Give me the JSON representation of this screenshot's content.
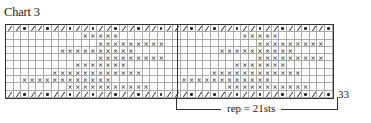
{
  "title": "Chart 3",
  "row_number": "33",
  "repeat_label": "rep = 21sts",
  "grid": {
    "columns": 43,
    "repeat_start_col": 22,
    "repeat_width": 21,
    "top_row": "//•//•//•//•//•//•//•///•//•//•//•//•//•//•",
    "bottom_row": "//•//•//•//•//•//•//•///•//•//•//•//•//•//•",
    "pattern_rows_local_ranges": [
      [
        9,
        13
      ],
      [
        11,
        19
      ],
      [
        6,
        15
      ],
      [
        11,
        19
      ],
      [
        8,
        14
      ],
      [
        5,
        16
      ],
      [
        1,
        12
      ],
      [
        7,
        17
      ]
    ]
  },
  "legend_symbols": {
    "slash": "/",
    "dot": "•",
    "cross": "×"
  }
}
